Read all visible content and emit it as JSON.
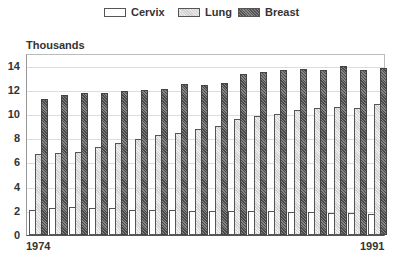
{
  "chart_data": {
    "type": "bar",
    "title": "",
    "xlabel": "",
    "ylabel": "Thousands",
    "ylim": [
      0,
      14.8
    ],
    "yticks": [
      0,
      2,
      4,
      6,
      8,
      10,
      12,
      14
    ],
    "grid": true,
    "legend_position": "top",
    "x_tick_labels_shown": [
      "1974",
      "1991"
    ],
    "categories": [
      "1974",
      "1975",
      "1976",
      "1977",
      "1978",
      "1979",
      "1980",
      "1981",
      "1982",
      "1983",
      "1984",
      "1985",
      "1986",
      "1987",
      "1988",
      "1989",
      "1990",
      "1991"
    ],
    "series": [
      {
        "name": "Cervix",
        "values": [
          2.1,
          2.2,
          2.3,
          2.2,
          2.2,
          2.1,
          2.1,
          2.1,
          2.0,
          2.0,
          1.95,
          1.95,
          2.0,
          1.9,
          1.9,
          1.85,
          1.8,
          1.7
        ]
      },
      {
        "name": "Lung",
        "values": [
          6.7,
          6.8,
          6.9,
          7.3,
          7.6,
          7.9,
          8.3,
          8.4,
          8.8,
          9.0,
          9.6,
          9.8,
          10.0,
          10.3,
          10.5,
          10.6,
          10.5,
          10.8
        ]
      },
      {
        "name": "Breast",
        "values": [
          11.2,
          11.6,
          11.7,
          11.75,
          11.9,
          12.0,
          12.1,
          12.5,
          12.4,
          12.6,
          13.3,
          13.5,
          13.6,
          13.7,
          13.65,
          14.0,
          13.6,
          13.8
        ]
      }
    ]
  },
  "legend": {
    "items": [
      {
        "label": "Cervix",
        "x": 104
      },
      {
        "label": "Lung",
        "x": 178
      },
      {
        "label": "Breast",
        "x": 238
      }
    ]
  },
  "axis": {
    "ylabel": "Thousands",
    "x_first": "1974",
    "x_last": "1991"
  }
}
